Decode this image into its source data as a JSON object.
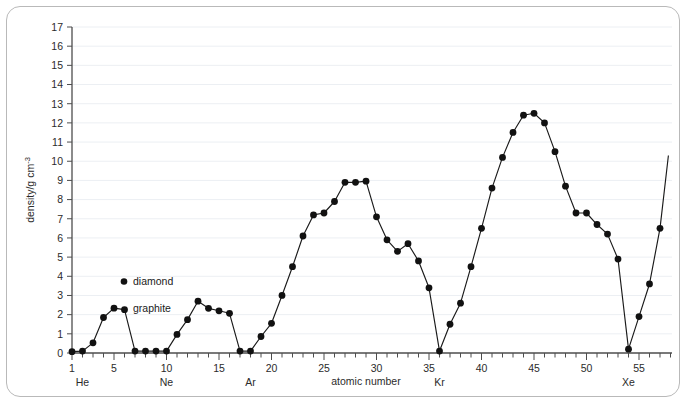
{
  "chart_data": {
    "type": "line",
    "title": "",
    "xlabel": "atomic number",
    "ylabel": "density/g cm",
    "ylabel_sup": "-3",
    "xlim": [
      1,
      57
    ],
    "ylim": [
      0,
      17
    ],
    "grid": true,
    "legend_position": "inside-left",
    "x_ticks": [
      1,
      5,
      10,
      15,
      20,
      25,
      30,
      35,
      40,
      45,
      50,
      55
    ],
    "x_minor_tick_step": 1,
    "y_ticks": [
      0,
      1,
      2,
      3,
      4,
      5,
      6,
      7,
      8,
      9,
      10,
      11,
      12,
      13,
      14,
      15,
      16,
      17
    ],
    "element_annotations": [
      {
        "label": "He",
        "x": 2
      },
      {
        "label": "Ne",
        "x": 10
      },
      {
        "label": "Ar",
        "x": 18
      },
      {
        "label": "Kr",
        "x": 36
      },
      {
        "label": "Xe",
        "x": 54
      }
    ],
    "legend": [
      {
        "label": "diamond",
        "marker": "dot"
      },
      {
        "label": "graphite",
        "marker": "none"
      }
    ],
    "series": [
      {
        "name": "density",
        "x": [
          1,
          2,
          3,
          4,
          5,
          6,
          7,
          8,
          9,
          10,
          11,
          12,
          13,
          14,
          15,
          16,
          17,
          18,
          19,
          20,
          21,
          22,
          23,
          24,
          25,
          26,
          27,
          28,
          29,
          30,
          31,
          32,
          33,
          34,
          35,
          36,
          37,
          38,
          39,
          40,
          41,
          42,
          43,
          44,
          45,
          46,
          47,
          48,
          49,
          50,
          51,
          52,
          53,
          54,
          55,
          56,
          57
        ],
        "values": [
          0.07,
          0.1,
          0.53,
          1.85,
          2.34,
          2.26,
          0.1,
          0.1,
          0.1,
          0.1,
          0.97,
          1.74,
          2.7,
          2.33,
          2.2,
          2.07,
          0.1,
          0.1,
          0.86,
          1.55,
          3.0,
          4.5,
          6.1,
          7.2,
          7.3,
          7.9,
          8.9,
          8.9,
          8.96,
          7.1,
          5.9,
          5.3,
          5.7,
          4.8,
          3.4,
          0.1,
          1.5,
          2.6,
          4.5,
          6.5,
          8.6,
          10.2,
          11.5,
          12.4,
          12.5,
          12.0,
          10.5,
          8.7,
          7.3,
          7.3,
          6.7,
          6.2,
          4.9,
          0.2,
          1.9,
          3.6,
          6.5
        ],
        "tail_x": 57.8,
        "tail_value": 10.3
      }
    ],
    "diamond_point": {
      "x": 6,
      "value": 3.5
    }
  }
}
